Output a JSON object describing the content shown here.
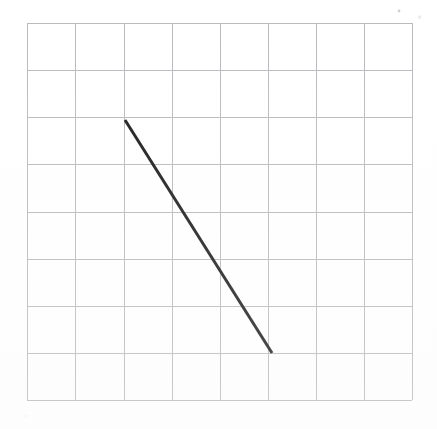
{
  "figure": {
    "background_color": "#ffffff",
    "canvas": {
      "width": 437,
      "height": 429
    }
  },
  "grid": {
    "name": "square-grid",
    "stroke_color": "#b9babd",
    "stroke_width": 1,
    "columns": 8,
    "rows": 8,
    "x_left": 27,
    "x_right": 412,
    "y_top": 23,
    "y_bottom": 400,
    "cell_width": 48.1,
    "cell_height": 47.1,
    "vertical_line_x": [
      27,
      75,
      124,
      172,
      220,
      268,
      316,
      364,
      412
    ],
    "horizontal_line_y": [
      23,
      70,
      117,
      164,
      212,
      259,
      306,
      353,
      400
    ]
  },
  "segment": {
    "name": "diagonal-line-segment",
    "stroke_color": "#1a1a1a",
    "stroke_width": 3,
    "start": {
      "x": 125,
      "y": 120,
      "grid_col": 2,
      "grid_row": 2
    },
    "end": {
      "x": 272,
      "y": 353,
      "grid_col": 5,
      "grid_row": 7
    },
    "run_cells": 3,
    "rise_cells": -5,
    "slope_pixels": -1.585,
    "slope_cells": -1.667,
    "direction": "down-right"
  },
  "chart_data": {
    "type": "line",
    "xlabel": "",
    "ylabel": "",
    "grid": true,
    "legend": "none",
    "xlim": [
      0,
      8
    ],
    "ylim": [
      0,
      8
    ],
    "x": [
      2,
      5
    ],
    "y": [
      6,
      1
    ],
    "series": [
      {
        "name": "segment",
        "points": [
          {
            "x": 2,
            "y": 6
          },
          {
            "x": 5,
            "y": 1
          }
        ],
        "color": "#1a1a1a"
      }
    ],
    "annotations": []
  },
  "artifacts": {
    "speck_top_right": {
      "x": 399,
      "y": 11,
      "color": "#bfc0c4"
    }
  }
}
